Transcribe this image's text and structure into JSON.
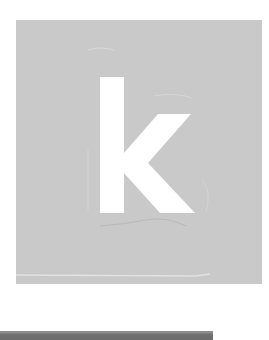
{
  "logo": {
    "letter": "k",
    "icon": "letter-k-logo-icon",
    "colors": {
      "tile_background": "#c9c9c9",
      "letter_fill": "#ffffff",
      "page_background": "#ffffff",
      "bottom_bar": "#6e6e6e"
    }
  }
}
